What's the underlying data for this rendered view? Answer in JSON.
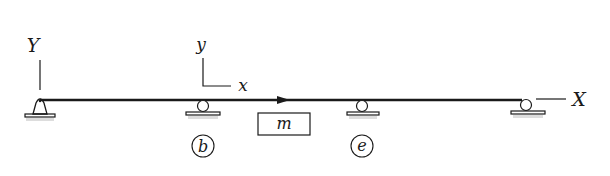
{
  "diagram": {
    "type": "beam-support-diagram",
    "colors": {
      "line": "#1a1a1a",
      "background": "#ffffff",
      "ground_shadow": "#cfcfcf"
    },
    "global_axes": {
      "vertical_label": "Y",
      "horizontal_label": "X"
    },
    "local_axes": {
      "vertical_label": "y",
      "horizontal_label": "x"
    },
    "mass": {
      "label": "m"
    },
    "supports": [
      {
        "type": "pin",
        "position": "left-end"
      },
      {
        "type": "roller",
        "position": "b",
        "label": "b"
      },
      {
        "type": "roller",
        "position": "e",
        "label": "e"
      },
      {
        "type": "roller",
        "position": "right-end"
      }
    ],
    "beam": {
      "direction_arrow": "right"
    }
  }
}
